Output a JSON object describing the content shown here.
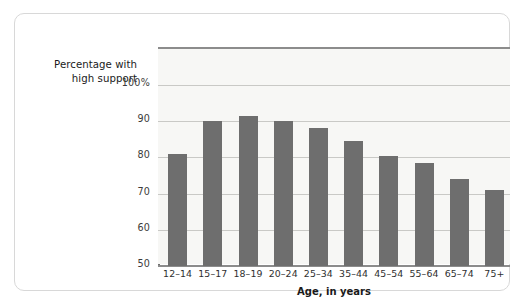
{
  "chart_data": {
    "type": "bar",
    "title": "",
    "subtitle": "",
    "xlabel": "Age, in years",
    "ylabel": "Percentage with high support",
    "ylabel_line1": "Percentage with",
    "ylabel_line2": "high support",
    "categories": [
      "12–14",
      "15–17",
      "18–19",
      "20–24",
      "25–34",
      "35–44",
      "45–54",
      "55–64",
      "65–74",
      "75+"
    ],
    "values": [
      81,
      90,
      91.5,
      90,
      88,
      84.5,
      80.5,
      78.5,
      74,
      71
    ],
    "ylim": [
      50,
      100
    ],
    "ytick_labels": [
      "100%",
      "90",
      "80",
      "70",
      "60",
      "50"
    ],
    "ytick_values": [
      100,
      90,
      80,
      70,
      60,
      50
    ],
    "grid": true,
    "legend": "none",
    "bar_color": "#6e6e6e",
    "plot_background": "#f7f7f5",
    "gridline_color": "#c9c9c6",
    "axis_color": "#8c8c8c"
  }
}
